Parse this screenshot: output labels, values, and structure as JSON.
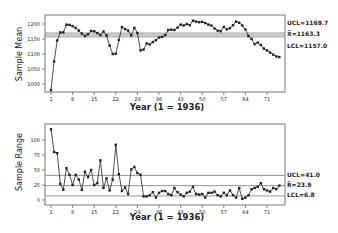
{
  "chart_data": [
    {
      "type": "line",
      "title": "Xbar chart",
      "xlabel": "Year (1 = 1936)",
      "ylabel": "Sample Mean",
      "x_ticks": [
        1,
        8,
        15,
        22,
        29,
        36,
        43,
        50,
        57,
        64,
        71
      ],
      "y_ticks": [
        1000,
        1050,
        1100,
        1150,
        1200
      ],
      "ylim": [
        985,
        1230
      ],
      "xlim": [
        0,
        76
      ],
      "grid": false,
      "control_lines": {
        "ucl": {
          "label": "UCL=1169.7",
          "value": 1169.7
        },
        "center": {
          "label": "X̅=1163.3",
          "value": 1163.3
        },
        "lcl": {
          "label": "LCL=1157.0",
          "value": 1157.0
        }
      },
      "x": [
        1,
        2,
        3,
        4,
        5,
        6,
        7,
        8,
        9,
        10,
        11,
        12,
        13,
        14,
        15,
        16,
        17,
        18,
        19,
        20,
        21,
        22,
        23,
        24,
        25,
        26,
        27,
        28,
        29,
        30,
        31,
        32,
        33,
        34,
        35,
        36,
        37,
        38,
        39,
        40,
        41,
        42,
        43,
        44,
        45,
        46,
        47,
        48,
        49,
        50,
        51,
        52,
        53,
        54,
        55,
        56,
        57,
        58,
        59,
        60,
        61,
        62,
        63,
        64,
        65,
        66,
        67,
        68,
        69,
        70,
        71,
        72,
        73,
        74,
        75
      ],
      "values": [
        980,
        1075,
        1145,
        1172,
        1172,
        1198,
        1197,
        1193,
        1187,
        1178,
        1168,
        1160,
        1166,
        1177,
        1176,
        1170,
        1163,
        1175,
        1162,
        1128,
        1100,
        1101,
        1147,
        1190,
        1183,
        1178,
        1162,
        1187,
        1170,
        1112,
        1115,
        1135,
        1132,
        1140,
        1146,
        1155,
        1157,
        1163,
        1180,
        1181,
        1180,
        1188,
        1198,
        1195,
        1200,
        1196,
        1211,
        1208,
        1206,
        1207,
        1203,
        1198,
        1195,
        1185,
        1178,
        1176,
        1190,
        1182,
        1186,
        1196,
        1208,
        1204,
        1195,
        1182,
        1160,
        1150,
        1133,
        1138,
        1130,
        1118,
        1112,
        1105,
        1098,
        1092,
        1090
      ]
    },
    {
      "type": "line",
      "title": "R chart",
      "xlabel": "Year (1 = 1936)",
      "ylabel": "Sample Range",
      "x_ticks": [
        1,
        8,
        15,
        22,
        29,
        36,
        43,
        50,
        57,
        64,
        71
      ],
      "y_ticks": [
        0,
        25,
        50,
        75,
        100
      ],
      "ylim": [
        -8,
        128
      ],
      "xlim": [
        0,
        76
      ],
      "grid": false,
      "control_lines": {
        "ucl": {
          "label": "UCL=41.0",
          "value": 41.0
        },
        "center": {
          "label": "R̅=23.9",
          "value": 23.9
        },
        "lcl": {
          "label": "LCL=6.8",
          "value": 6.8
        }
      },
      "x": [
        1,
        2,
        3,
        4,
        5,
        6,
        7,
        8,
        9,
        10,
        11,
        12,
        13,
        14,
        15,
        16,
        17,
        18,
        19,
        20,
        21,
        22,
        23,
        24,
        25,
        26,
        27,
        28,
        29,
        30,
        31,
        32,
        33,
        34,
        35,
        36,
        37,
        38,
        39,
        40,
        41,
        42,
        43,
        44,
        45,
        46,
        47,
        48,
        49,
        50,
        51,
        52,
        53,
        54,
        55,
        56,
        57,
        58,
        59,
        60,
        61,
        62,
        63,
        64,
        65,
        66,
        67,
        68,
        69,
        70,
        71,
        72,
        73,
        74,
        75
      ],
      "values": [
        118,
        80,
        78,
        27,
        17,
        53,
        42,
        25,
        42,
        34,
        17,
        47,
        38,
        50,
        25,
        28,
        66,
        20,
        36,
        16,
        34,
        92,
        43,
        15,
        21,
        10,
        51,
        55,
        45,
        42,
        6,
        6,
        8,
        13,
        4,
        12,
        15,
        15,
        10,
        8,
        20,
        13,
        9,
        6,
        12,
        14,
        22,
        10,
        9,
        10,
        4,
        12,
        12,
        14,
        8,
        6,
        12,
        8,
        16,
        8,
        4,
        20,
        2,
        4,
        8,
        18,
        20,
        22,
        28,
        18,
        16,
        14,
        20,
        18,
        24
      ]
    }
  ],
  "top_chart": {
    "ylabel": "Sample Mean",
    "xlabel": "Year (1 = 1936)",
    "ucl_label": "UCL=1169.7",
    "center_label": "X̅=1163.3",
    "lcl_label": "LCL=1157.0"
  },
  "bottom_chart": {
    "ylabel": "Sample Range",
    "xlabel": "Year (1 = 1936)",
    "ucl_label": "UCL=41.0",
    "center_label": "R̅=23.9",
    "lcl_label": "LCL=6.8"
  },
  "colors": {
    "line": "#222222",
    "control": "#888888",
    "frame": "#555555"
  }
}
